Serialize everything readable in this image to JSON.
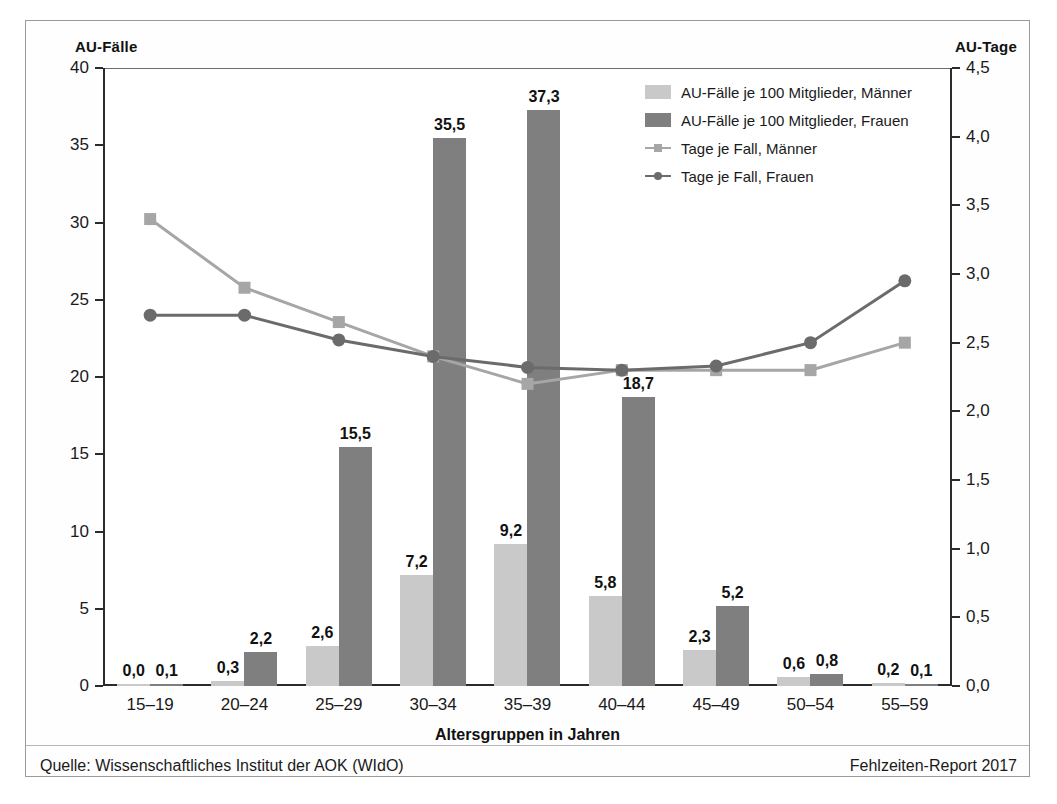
{
  "figure": {
    "left_axis_title": "AU-Fälle",
    "right_axis_title": "AU-Tage",
    "source_note": "Quelle: Wissenschaftliches Institut der AOK (WIdO)",
    "report_note": "Fehlzeiten-Report 2017"
  },
  "legend": {
    "position": "top-right",
    "items": [
      {
        "label": "AU-Fälle je 100 Mitglieder, Männer",
        "marker": "bar-swatch-light",
        "color": "#c9c9c9"
      },
      {
        "label": "AU-Fälle je 100 Mitglieder, Frauen",
        "marker": "bar-swatch-dark",
        "color": "#7f7f7f"
      },
      {
        "label": "Tage je Fall, Männer",
        "marker": "line-square",
        "color": "#a6a6a6"
      },
      {
        "label": "Tage je Fall, Frauen",
        "marker": "line-circle",
        "color": "#6b6b6b"
      }
    ]
  },
  "chart_data": {
    "type": "bar",
    "title": "",
    "xlabel": "Altersgruppen in Jahren",
    "ylabel": "AU-Fälle",
    "y2label": "AU-Tage",
    "grid": false,
    "categories": [
      "15–19",
      "20–24",
      "25–29",
      "30–34",
      "35–39",
      "40–44",
      "45–49",
      "50–54",
      "55–59"
    ],
    "ylim": [
      0,
      40
    ],
    "yticks": [
      "0",
      "5",
      "10",
      "15",
      "20",
      "25",
      "30",
      "35",
      "40"
    ],
    "y2lim": [
      0,
      4.5
    ],
    "y2ticks": [
      "0,0",
      "0,5",
      "1,0",
      "1,5",
      "2,0",
      "2,5",
      "3,0",
      "3,5",
      "4,0",
      "4,5"
    ],
    "series": [
      {
        "name": "AU-Fälle je 100 Mitglieder, Männer",
        "kind": "bar",
        "axis": "left",
        "color": "#c9c9c9",
        "values": [
          0.0,
          0.3,
          2.6,
          7.2,
          9.2,
          5.8,
          2.3,
          0.6,
          0.2
        ],
        "labels": [
          "0,0",
          "0,3",
          "2,6",
          "7,2",
          "9,2",
          "5,8",
          "2,3",
          "0,6",
          "0,2"
        ]
      },
      {
        "name": "AU-Fälle je 100 Mitglieder, Frauen",
        "kind": "bar",
        "axis": "left",
        "color": "#7f7f7f",
        "values": [
          0.1,
          2.2,
          15.5,
          35.5,
          37.3,
          18.7,
          5.2,
          0.8,
          0.1
        ],
        "labels": [
          "0,1",
          "2,2",
          "15,5",
          "35,5",
          "37,3",
          "18,7",
          "5,2",
          "0,8",
          "0,1"
        ]
      },
      {
        "name": "Tage je Fall, Männer",
        "kind": "line",
        "axis": "right",
        "color": "#a6a6a6",
        "marker": "square",
        "values": [
          3.4,
          2.9,
          2.65,
          2.4,
          2.2,
          2.3,
          2.3,
          2.3,
          2.5
        ]
      },
      {
        "name": "Tage je Fall, Frauen",
        "kind": "line",
        "axis": "right",
        "color": "#6b6b6b",
        "marker": "circle",
        "values": [
          2.7,
          2.7,
          2.52,
          2.4,
          2.32,
          2.3,
          2.33,
          2.5,
          2.95
        ]
      }
    ]
  }
}
